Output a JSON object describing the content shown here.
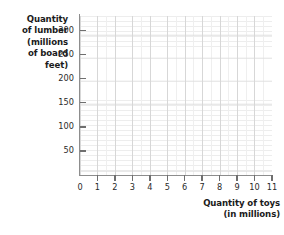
{
  "chart_data": {
    "type": "scatter",
    "title": "",
    "subtitle": "",
    "xlabel_lines": [
      "Quantity of toys",
      "(in millions)"
    ],
    "ylabel_lines": [
      "Quantity",
      "of lumber",
      "(millions",
      "of board",
      "feet)"
    ],
    "xlabel": "Quantity of toys (in millions)",
    "ylabel": "Quantity of lumber (millions of board feet)",
    "x_ticks": [
      0,
      1,
      2,
      3,
      4,
      5,
      6,
      7,
      8,
      9,
      10,
      11
    ],
    "x_tick_labels": [
      "0",
      "1",
      "2",
      "3",
      "4",
      "5",
      "6",
      "7",
      "8",
      "9",
      "10",
      "11"
    ],
    "y_ticks": [
      50,
      100,
      150,
      200,
      250,
      300
    ],
    "y_tick_labels": [
      "50",
      "100",
      "150",
      "200",
      "250",
      "300"
    ],
    "xlim": [
      0,
      11
    ],
    "ylim": [
      0,
      330
    ],
    "grid": true,
    "grid_minor": true,
    "legend": false,
    "legend_position": "none",
    "series": [],
    "annotations": [],
    "note": "Blank coordinate grid with no plotted data points or curves.",
    "colors": {
      "background": "#ffffff",
      "axis_line": "#8d8d8d",
      "tick_mark": "#6f6f6f",
      "grid_minor": "#ededed",
      "grid_major": "#d7d7d7",
      "text": "#1b1b1b",
      "tick_text": "#2a2a2a"
    }
  },
  "axes": {
    "y_title": {
      "lines": [
        "Quantity",
        "of lumber",
        "(millions",
        "of board",
        "feet)"
      ]
    },
    "x_title": {
      "lines": [
        "Quantity of toys",
        "(in millions)"
      ]
    }
  }
}
